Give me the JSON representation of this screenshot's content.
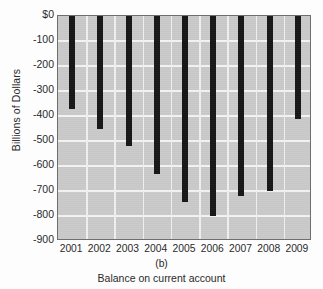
{
  "figure": {
    "panel_letter": "(b)",
    "caption": "Balance on current account",
    "background_color": "#c9c9c9",
    "bar_color": "#151515",
    "grid_color": "#f3f3f3",
    "frame_color": "#6e6e6e"
  },
  "chart_data": {
    "type": "bar",
    "title": "Balance on current account",
    "xlabel": "",
    "ylabel": "Billions of Dollars",
    "categories": [
      "2001",
      "2002",
      "2003",
      "2004",
      "2005",
      "2006",
      "2007",
      "2008",
      "2009"
    ],
    "values": [
      -370,
      -450,
      -520,
      -630,
      -745,
      -800,
      -720,
      -700,
      -410
    ],
    "ylim": [
      -900,
      0
    ],
    "yticks": [
      0,
      -100,
      -200,
      -300,
      -400,
      -500,
      -600,
      -700,
      -800,
      -900
    ],
    "ytick_labels": [
      "$0",
      "-100",
      "-200",
      "-300",
      "-400",
      "-500",
      "-600",
      "-700",
      "-800",
      "-900"
    ],
    "grid": true,
    "legend": null,
    "orientation": "vertical",
    "baseline": 0
  }
}
